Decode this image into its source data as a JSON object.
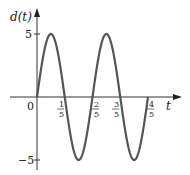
{
  "chart_data": {
    "type": "line",
    "title": "",
    "function": "d(t) = 5 sin(5πt)",
    "xlabel": "t",
    "ylabel": "d(t)",
    "xlim": [
      0,
      0.8
    ],
    "ylim": [
      -5,
      5
    ],
    "grid": false,
    "legend": null,
    "x_ticks": [
      {
        "value": 0,
        "label": "0"
      },
      {
        "value": 0.2,
        "num": "1",
        "den": "5"
      },
      {
        "value": 0.4,
        "num": "2",
        "den": "5"
      },
      {
        "value": 0.6,
        "num": "3",
        "den": "5"
      },
      {
        "value": 0.8,
        "num": "4",
        "den": "5"
      }
    ],
    "y_ticks": [
      {
        "value": 5,
        "label": "5"
      },
      {
        "value": -5,
        "label": "−5"
      }
    ],
    "series": [
      {
        "name": "d(t)",
        "x": [
          0,
          0.1,
          0.2,
          0.3,
          0.4,
          0.5,
          0.6,
          0.7,
          0.8
        ],
        "y": [
          0,
          5,
          0,
          -5,
          0,
          5,
          0,
          -5,
          0
        ]
      }
    ],
    "color": "#555555"
  }
}
